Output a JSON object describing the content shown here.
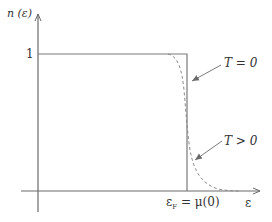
{
  "diagram": {
    "y_axis_label": "n (ε)",
    "x_axis_label": "ε",
    "y_tick_label": "1",
    "fermi_label_main": "ε",
    "fermi_label_sub": "F",
    "fermi_label_rest": " = μ(0)",
    "curves": [
      {
        "name": "T = 0",
        "label": "T = 0",
        "style": "solid",
        "color": "#7a7a7a"
      },
      {
        "name": "T > 0",
        "label": "T > 0",
        "style": "dashed",
        "color": "#8a8a8a"
      }
    ],
    "colors": {
      "axis": "#6b6b6b",
      "text": "#333333",
      "background": "#ffffff"
    }
  }
}
